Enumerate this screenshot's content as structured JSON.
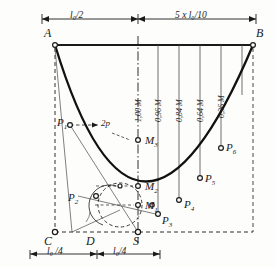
{
  "figure": {
    "type": "engineering-construction-diagram"
  },
  "corners": {
    "a": "A",
    "b": "B",
    "c": "C",
    "d": "D",
    "s": "S"
  },
  "dimensions": {
    "top_left": "l₀/2",
    "top_right": "5 x l₀/10",
    "bottom_left": "l₀ /4",
    "bottom_right": "l₀/4"
  },
  "curve_points": [
    {
      "id": "p1",
      "label": "P",
      "sub": "1"
    },
    {
      "id": "p2",
      "label": "P",
      "sub": "2"
    },
    {
      "id": "p3",
      "label": "P",
      "sub": "3"
    },
    {
      "id": "p4",
      "label": "P",
      "sub": "4"
    },
    {
      "id": "p5",
      "label": "P",
      "sub": "5"
    },
    {
      "id": "p6",
      "label": "P",
      "sub": "6"
    }
  ],
  "center_points": [
    {
      "id": "m1",
      "label": "M",
      "sub": "1"
    },
    {
      "id": "m2",
      "label": "M",
      "sub": "2"
    },
    {
      "id": "m3",
      "label": "M",
      "sub": "3"
    }
  ],
  "ordinates": [
    {
      "id": "ord-1",
      "text": "1,00 M"
    },
    {
      "id": "ord-2",
      "text": "0,96 M"
    },
    {
      "id": "ord-3",
      "text": "0,84 M"
    },
    {
      "id": "ord-4",
      "text": "0,64 M"
    },
    {
      "id": "ord-5",
      "text": "0,36 M"
    }
  ],
  "annotations": {
    "two_p": "2p"
  },
  "colors": {
    "ink": "#1a1a1a",
    "curve": "#111111",
    "thin": "#555555",
    "paper": "#fdfdfb"
  }
}
